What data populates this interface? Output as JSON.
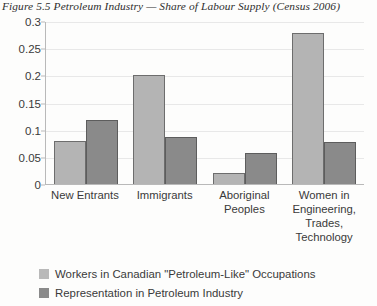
{
  "chart_data": {
    "type": "bar",
    "title": "Figure 5.5 Petroleum Industry — Share of Labour Supply (Census 2006)",
    "xlabel": "",
    "ylabel": "",
    "ylim": [
      0,
      0.3
    ],
    "yticks": [
      0,
      0.05,
      0.1,
      0.15,
      0.2,
      0.25,
      0.3
    ],
    "ytick_labels": [
      "0",
      "0.05",
      "0.1",
      "0.15",
      "0.2",
      "0.25",
      "0.3"
    ],
    "grid": true,
    "legend_position": "below",
    "categories": [
      "New Entrants",
      "Immigrants",
      "Aboriginal\nPeoples",
      "Women in\nEngineering,\nTrades,\nTechnology"
    ],
    "series": [
      {
        "name": "Workers in Canadian \"Petroleum-Like\" Occupations",
        "color": "#b4b4b4",
        "values": [
          0.08,
          0.2,
          0.021,
          0.278
        ]
      },
      {
        "name": "Representation in Petroleum Industry",
        "color": "#8a8a8a",
        "values": [
          0.118,
          0.087,
          0.057,
          0.077
        ]
      }
    ]
  }
}
